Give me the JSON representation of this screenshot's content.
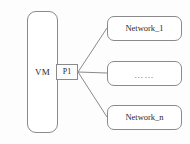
{
  "diagram": {
    "background_color": "#fdfdfd",
    "stroke_color": "#8a8a8a",
    "text_color": "#2b2b2b",
    "vm": {
      "label": "VM"
    },
    "port": {
      "label": "P1"
    },
    "networks": [
      {
        "label": "Network_1"
      },
      {
        "label": "……"
      },
      {
        "label": "Network_n"
      }
    ]
  }
}
